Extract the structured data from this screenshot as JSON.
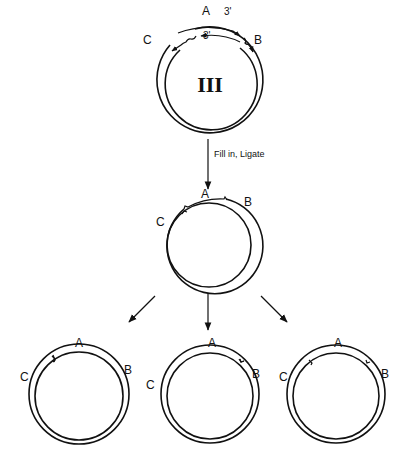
{
  "figure": {
    "type": "plasmid repair schematic",
    "top_plasmid": {
      "name": "III",
      "labels": {
        "a": "A",
        "b": "B",
        "c": "C"
      },
      "strand_end_labels": [
        "3'",
        "3'"
      ]
    },
    "step_arrow_label": "Fill in, Ligate",
    "middle_plasmid": {
      "labels": {
        "a": "A",
        "b": "B",
        "c": "C"
      }
    },
    "products": [
      {
        "id": "product-left",
        "labels": {
          "a": "A",
          "b": "B",
          "c": "C"
        },
        "nick_sites": [
          "between C and A"
        ]
      },
      {
        "id": "product-center",
        "labels": {
          "a": "A",
          "b": "B",
          "c": "C"
        },
        "nick_sites": [
          "between A and B"
        ]
      },
      {
        "id": "product-right",
        "labels": {
          "a": "A",
          "b": "B",
          "c": "C"
        },
        "nick_sites": [
          "between C and A",
          "between A and B"
        ]
      }
    ]
  },
  "colors": {
    "ink": "#111111",
    "background": "#ffffff"
  }
}
